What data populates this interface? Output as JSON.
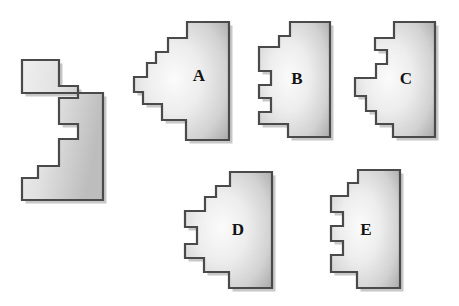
{
  "page": {
    "background_color": "#ffffff",
    "width": 459,
    "height": 306
  },
  "style": {
    "outline_color": "#4a4a4a",
    "fill_light": "#f2f2f2",
    "fill_mid": "#d9d9d9",
    "fill_dark": "#a8a8a8",
    "shadow_color": "#9a9a9a",
    "label_color": "#141414"
  },
  "figures": [
    {
      "id": "reference",
      "label": "",
      "role": "reference-shape",
      "label_x": 0,
      "label_y": 0,
      "points": "22,93 103,93 103,200 22,200 22,178 38,178 38,166 59,166 59,139 78,139 78,124 59,124 59,98 78,98 78,86 59,86 59,60 22,60"
    },
    {
      "id": "A",
      "label": "A",
      "role": "option-shape",
      "label_x": 199,
      "label_y": 77,
      "points": "187,22 229,22 229,140 186,140 186,120 162,120 162,104 143,104 143,92 134,92 134,77 147,77 147,63 156,63 156,52 168,52 168,38 187,38"
    },
    {
      "id": "B",
      "label": "B",
      "role": "option-shape",
      "label_x": 297,
      "label_y": 80,
      "points": "290,22 330,22 330,137 288,137 288,124 259,124 259,112 271,112 271,98 259,98 259,85 271,85 271,71 259,71 259,47 279,47 279,36 290,36"
    },
    {
      "id": "C",
      "label": "C",
      "role": "option-shape",
      "label_x": 406,
      "label_y": 80,
      "points": "394,22 435,22 435,137 393,137 393,124 376,124 376,111 366,111 366,96 355,96 355,78 376,78 376,64 387,64 387,50 375,50 375,38 394,38"
    },
    {
      "id": "D",
      "label": "D",
      "role": "option-shape",
      "label_x": 238,
      "label_y": 231,
      "points": "230,172 272,172 272,288 229,288 229,272 204,272 204,258 185,258 185,244 197,244 197,227 185,227 185,211 205,211 205,197 216,197 216,186 230,186"
    },
    {
      "id": "E",
      "label": "E",
      "role": "option-shape",
      "label_x": 366,
      "label_y": 231,
      "points": "358,170 400,170 400,288 357,288 357,272 331,272 331,255 343,255 343,241 331,241 331,226 343,226 343,212 331,212 331,196 348,196 348,183 358,183"
    }
  ]
}
